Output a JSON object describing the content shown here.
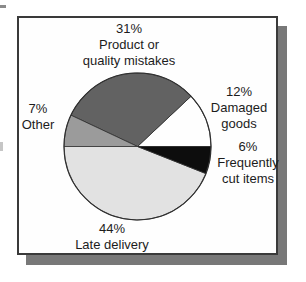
{
  "chart_data": {
    "type": "pie",
    "title": "",
    "start_angle_deg": 0,
    "direction": "counterclockwise",
    "outline_color": "#2e2e2e",
    "slices": [
      {
        "label": "Damaged goods",
        "value": 12,
        "color": "#fefefe"
      },
      {
        "label": "Product or quality mistakes",
        "value": 31,
        "color": "#626262"
      },
      {
        "label": "Other",
        "value": 7,
        "color": "#9b9b9b"
      },
      {
        "label": "Late delivery",
        "value": 44,
        "color": "#e2e2e2"
      },
      {
        "label": "Frequently cut items",
        "value": 6,
        "color": "#0d0d0d"
      }
    ]
  },
  "labels": {
    "product_quality": {
      "pct": "31%",
      "name": "Product or\nquality mistakes"
    },
    "damaged_goods": {
      "pct": "12%",
      "name": "Damaged\ngoods"
    },
    "frequently_cut": {
      "pct": "6%",
      "name": "Frequently\ncut items"
    },
    "other": {
      "pct": "7%",
      "name": "Other"
    },
    "late_delivery": {
      "pct": "44%",
      "name": "Late delivery"
    }
  },
  "colors": {
    "panel_background": "#fefefe",
    "panel_border": "#3a3a3a",
    "panel_shadow": "#787878",
    "text": "#1c1c1c"
  }
}
